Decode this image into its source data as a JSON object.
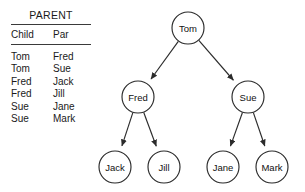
{
  "table": {
    "title": "PARENT",
    "columns": [
      "Child",
      "Par"
    ],
    "rows": [
      {
        "child": "Tom",
        "par": "Fred"
      },
      {
        "child": "Tom",
        "par": "Sue"
      },
      {
        "child": "Fred",
        "par": "Jack"
      },
      {
        "child": "Fred",
        "par": "Jill"
      },
      {
        "child": "Sue",
        "par": "Jane"
      },
      {
        "child": "Sue",
        "par": "Mark"
      }
    ]
  },
  "tree": {
    "nodes": [
      {
        "id": "tom",
        "label": "Tom",
        "cx": 188,
        "cy": 28,
        "r": 16
      },
      {
        "id": "fred",
        "label": "Fred",
        "cx": 138,
        "cy": 97,
        "r": 16
      },
      {
        "id": "sue",
        "label": "Sue",
        "cx": 248,
        "cy": 97,
        "r": 16
      },
      {
        "id": "jack",
        "label": "Jack",
        "cx": 115,
        "cy": 167,
        "r": 16
      },
      {
        "id": "jill",
        "label": "Jill",
        "cx": 164,
        "cy": 167,
        "r": 16
      },
      {
        "id": "jane",
        "label": "Jane",
        "cx": 223,
        "cy": 167,
        "r": 16
      },
      {
        "id": "mark",
        "label": "Mark",
        "cx": 272,
        "cy": 167,
        "r": 16
      }
    ],
    "edges": [
      {
        "from": "tom",
        "to": "fred"
      },
      {
        "from": "tom",
        "to": "sue"
      },
      {
        "from": "fred",
        "to": "jack"
      },
      {
        "from": "fred",
        "to": "jill"
      },
      {
        "from": "sue",
        "to": "jane"
      },
      {
        "from": "sue",
        "to": "mark"
      }
    ],
    "stroke_color": "#2b2b2b",
    "fill_color": "#ffffff",
    "text_color": "#111111"
  }
}
